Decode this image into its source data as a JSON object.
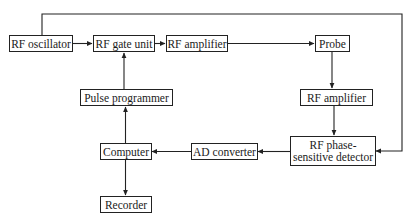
{
  "diagram": {
    "type": "block-diagram",
    "nodes": [
      {
        "id": "rf_oscillator",
        "label": "RF oscillator"
      },
      {
        "id": "rf_gate_unit",
        "label": "RF gate unit"
      },
      {
        "id": "rf_amplifier_tx",
        "label": "RF amplifier"
      },
      {
        "id": "probe",
        "label": "Probe"
      },
      {
        "id": "rf_amplifier_rx",
        "label": "RF amplifier"
      },
      {
        "id": "rf_psd",
        "label": "RF phase-sensitive detector",
        "label_lines": [
          "RF phase-",
          "sensitive detector"
        ]
      },
      {
        "id": "ad_converter",
        "label": "AD converter"
      },
      {
        "id": "computer",
        "label": "Computer"
      },
      {
        "id": "pulse_programmer",
        "label": "Pulse programmer"
      },
      {
        "id": "recorder",
        "label": "Recorder"
      }
    ],
    "edges": [
      {
        "from": "rf_oscillator",
        "to": "rf_gate_unit"
      },
      {
        "from": "rf_gate_unit",
        "to": "rf_amplifier_tx"
      },
      {
        "from": "rf_amplifier_tx",
        "to": "probe"
      },
      {
        "from": "probe",
        "to": "rf_amplifier_rx"
      },
      {
        "from": "rf_amplifier_rx",
        "to": "rf_psd"
      },
      {
        "from": "rf_oscillator",
        "to": "rf_psd",
        "note": "reference line routed over the top"
      },
      {
        "from": "rf_psd",
        "to": "ad_converter"
      },
      {
        "from": "ad_converter",
        "to": "computer"
      },
      {
        "from": "computer",
        "to": "pulse_programmer"
      },
      {
        "from": "pulse_programmer",
        "to": "rf_gate_unit"
      },
      {
        "from": "computer",
        "to": "recorder"
      }
    ]
  }
}
